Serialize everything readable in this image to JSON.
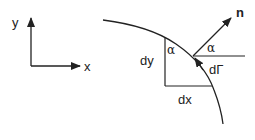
{
  "diagram": {
    "axes": {
      "x_label": "x",
      "y_label": "y"
    },
    "labels": {
      "normal": "n",
      "dy": "dy",
      "dx": "dx",
      "alpha_triangle": "α",
      "alpha_normal": "α",
      "d_gamma": "dΓ"
    },
    "colors": {
      "stroke": "#222222",
      "background": "#ffffff"
    }
  }
}
